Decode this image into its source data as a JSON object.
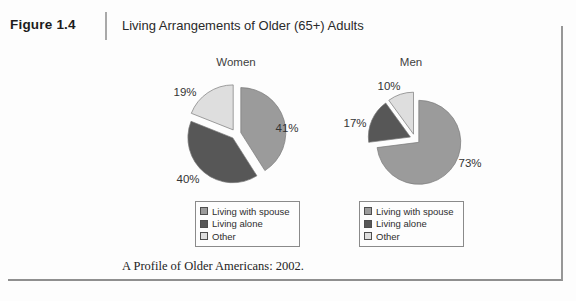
{
  "header": {
    "figure_label": "Figure 1.4",
    "title": "Living Arrangements of Older (65+) Adults"
  },
  "source": "A Profile of Older Americans: 2002.",
  "colors": {
    "living_with_spouse": "#9b9b9b",
    "living_alone": "#575757",
    "other": "#dedede",
    "slice_stroke": "#787878"
  },
  "chart_data": [
    {
      "type": "pie",
      "title": "Women",
      "exploded": true,
      "legend_position": "below",
      "slices": [
        {
          "label": "Living with spouse",
          "value": 41,
          "display": "41%",
          "color": "#9b9b9b"
        },
        {
          "label": "Living alone",
          "value": 40,
          "display": "40%",
          "color": "#575757"
        },
        {
          "label": "Other",
          "value": 19,
          "display": "19%",
          "color": "#dedede"
        }
      ]
    },
    {
      "type": "pie",
      "title": "Men",
      "exploded": true,
      "legend_position": "below",
      "slices": [
        {
          "label": "Living with spouse",
          "value": 73,
          "display": "73%",
          "color": "#9b9b9b"
        },
        {
          "label": "Living alone",
          "value": 17,
          "display": "17%",
          "color": "#575757"
        },
        {
          "label": "Other",
          "value": 10,
          "display": "10%",
          "color": "#dedede"
        }
      ]
    }
  ]
}
